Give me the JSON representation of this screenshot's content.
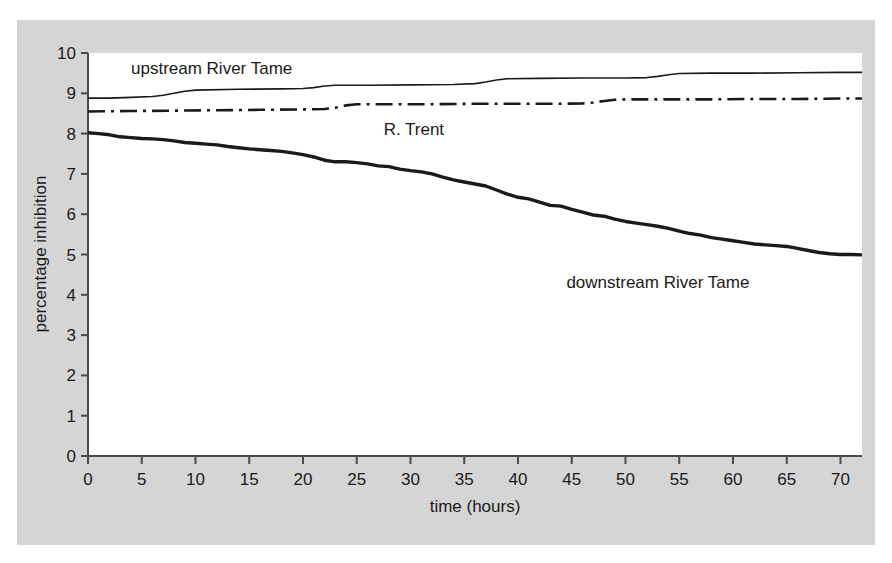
{
  "figure": {
    "background_color": "#d5d5d5",
    "page_color": "#ffffff",
    "plot_area_color": "#ffffff",
    "axis_color": "#4a4a4a",
    "line_color": "#1a1a1a"
  },
  "chart_data": {
    "type": "line",
    "title": "",
    "xlabel": "time (hours)",
    "ylabel": "percentage inhibition",
    "xlim": [
      0,
      72
    ],
    "ylim": [
      0,
      10
    ],
    "xticks": [
      0,
      5,
      10,
      15,
      20,
      25,
      30,
      35,
      40,
      45,
      50,
      55,
      60,
      65,
      70
    ],
    "yticks": [
      0,
      1,
      2,
      3,
      4,
      5,
      6,
      7,
      8,
      9,
      10
    ],
    "grid": false,
    "legend": "inline-labels",
    "series": [
      {
        "name": "upstream River Tame",
        "linestyle": "solid",
        "linewidth": 1.6,
        "color": "#1a1a1a",
        "label_position": {
          "x": 4,
          "y": 9.62
        },
        "x": [
          0,
          2,
          4,
          6,
          7,
          8,
          9,
          10,
          14,
          18,
          20,
          21,
          22,
          23,
          26,
          30,
          34,
          36,
          37,
          38,
          39,
          42,
          46,
          50,
          52,
          53,
          54,
          55,
          58,
          62,
          66,
          70,
          72
        ],
        "y": [
          8.88,
          8.88,
          8.9,
          8.92,
          8.95,
          9.0,
          9.05,
          9.08,
          9.1,
          9.11,
          9.12,
          9.14,
          9.18,
          9.2,
          9.2,
          9.21,
          9.22,
          9.24,
          9.28,
          9.33,
          9.36,
          9.37,
          9.38,
          9.38,
          9.39,
          9.42,
          9.46,
          9.49,
          9.5,
          9.5,
          9.51,
          9.52,
          9.52
        ]
      },
      {
        "name": "R. Trent",
        "linestyle": "dashdot",
        "linewidth": 2.6,
        "color": "#1a1a1a",
        "label_position": {
          "x": 27.5,
          "y": 8.12
        },
        "x": [
          0,
          4,
          8,
          12,
          16,
          20,
          22,
          23,
          24,
          25,
          28,
          32,
          36,
          40,
          44,
          46,
          47,
          48,
          49,
          50,
          54,
          58,
          62,
          66,
          70,
          72
        ],
        "y": [
          8.55,
          8.56,
          8.57,
          8.58,
          8.59,
          8.6,
          8.61,
          8.64,
          8.7,
          8.73,
          8.73,
          8.73,
          8.74,
          8.74,
          8.74,
          8.75,
          8.77,
          8.81,
          8.84,
          8.85,
          8.85,
          8.85,
          8.86,
          8.86,
          8.87,
          8.87
        ]
      },
      {
        "name": "downstream River Tame",
        "linestyle": "solid",
        "linewidth": 3.4,
        "color": "#1a1a1a",
        "label_position": {
          "x": 44.5,
          "y": 4.32
        },
        "x": [
          0,
          1,
          2,
          3,
          4,
          5,
          6,
          7,
          8,
          9,
          10,
          11,
          12,
          13,
          14,
          15,
          16,
          17,
          18,
          19,
          20,
          21,
          22,
          23,
          24,
          25,
          26,
          27,
          28,
          29,
          30,
          31,
          32,
          33,
          34,
          35,
          36,
          37,
          38,
          39,
          40,
          41,
          42,
          43,
          44,
          45,
          46,
          47,
          48,
          49,
          50,
          51,
          52,
          53,
          54,
          55,
          56,
          57,
          58,
          59,
          60,
          61,
          62,
          63,
          64,
          65,
          66,
          67,
          68,
          69,
          70,
          71,
          72
        ],
        "y": [
          8.02,
          8.0,
          7.97,
          7.92,
          7.9,
          7.88,
          7.87,
          7.85,
          7.82,
          7.78,
          7.76,
          7.74,
          7.72,
          7.68,
          7.65,
          7.62,
          7.6,
          7.58,
          7.56,
          7.52,
          7.48,
          7.42,
          7.34,
          7.3,
          7.3,
          7.28,
          7.25,
          7.2,
          7.18,
          7.12,
          7.08,
          7.05,
          7.0,
          6.92,
          6.85,
          6.8,
          6.75,
          6.7,
          6.6,
          6.5,
          6.42,
          6.38,
          6.3,
          6.22,
          6.2,
          6.12,
          6.05,
          5.98,
          5.95,
          5.88,
          5.82,
          5.78,
          5.74,
          5.7,
          5.65,
          5.58,
          5.52,
          5.48,
          5.42,
          5.38,
          5.34,
          5.3,
          5.26,
          5.24,
          5.22,
          5.2,
          5.15,
          5.1,
          5.05,
          5.02,
          5.0,
          5.0,
          4.99
        ]
      }
    ]
  }
}
